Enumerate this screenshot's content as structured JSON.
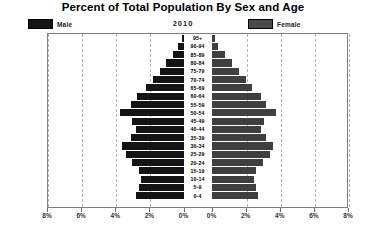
{
  "title": "Percent of Total Population By Sex and Age",
  "year": "2010",
  "legend": {
    "male_label": "Male",
    "female_label": "Female",
    "male_color": "#141414",
    "female_color": "#4a4a4a"
  },
  "chart_data": {
    "type": "bar",
    "subtype": "population-pyramid",
    "title": "Percent of Total Population By Sex and Age",
    "subtitle": "2010",
    "xlabel": "",
    "ylabel": "",
    "xlim": [
      0,
      8
    ],
    "x_unit": "%",
    "grid": true,
    "legend_position": "top",
    "orientation": "horizontal",
    "categories": [
      "95+",
      "90-94",
      "85-89",
      "80-84",
      "75-79",
      "70-74",
      "65-69",
      "60-64",
      "55-59",
      "50-54",
      "45-49",
      "40-44",
      "35-39",
      "30-34",
      "25-29",
      "20-24",
      "15-19",
      "10-14",
      "5-9",
      "0-4"
    ],
    "axis_tick_values": [
      8,
      6,
      4,
      2,
      0,
      0,
      2,
      4,
      6,
      8
    ],
    "axis_tick_labels": [
      "8%",
      "6%",
      "4%",
      "2%",
      "0%",
      "0%",
      "2%",
      "4%",
      "6%",
      "8%"
    ],
    "series": [
      {
        "name": "Male",
        "side": "left",
        "color": "#141414",
        "values": [
          0.1,
          0.3,
          0.6,
          1.0,
          1.4,
          1.8,
          2.2,
          2.7,
          3.1,
          3.7,
          3.0,
          2.8,
          3.1,
          3.6,
          3.4,
          3.0,
          2.6,
          2.5,
          2.6,
          2.8
        ]
      },
      {
        "name": "Female",
        "side": "right",
        "color": "#3f3f3f",
        "values": [
          0.2,
          0.4,
          0.8,
          1.2,
          1.6,
          2.0,
          2.4,
          2.9,
          3.2,
          3.8,
          3.1,
          2.9,
          3.2,
          3.6,
          3.4,
          3.0,
          2.6,
          2.5,
          2.6,
          2.7
        ]
      }
    ]
  }
}
